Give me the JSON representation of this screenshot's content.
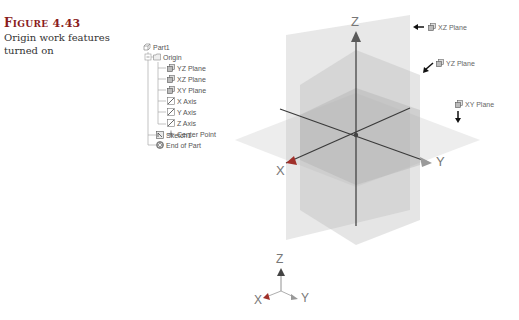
{
  "caption": {
    "figure_prefix": "F",
    "figure_word": "IGURE",
    "figure_number": "4.43",
    "description": "Origin work features turned on"
  },
  "browser_tree": {
    "items": [
      {
        "label": "Part1",
        "icon": "part-icon",
        "level": 0
      },
      {
        "label": "Origin",
        "icon": "folder-icon",
        "level": 1,
        "expanded": true
      },
      {
        "label": "YZ Plane",
        "icon": "work-plane-icon",
        "level": 2
      },
      {
        "label": "XZ Plane",
        "icon": "work-plane-icon",
        "level": 2
      },
      {
        "label": "XY Plane",
        "icon": "work-plane-icon",
        "level": 2
      },
      {
        "label": "X Axis",
        "icon": "work-axis-icon",
        "level": 2
      },
      {
        "label": "Y Axis",
        "icon": "work-axis-icon",
        "level": 2
      },
      {
        "label": "Z Axis",
        "icon": "work-axis-icon",
        "level": 2
      },
      {
        "label": "Center Point",
        "icon": "center-point-icon",
        "level": 2
      },
      {
        "label": "Sketch1",
        "icon": "sketch-icon",
        "level": 1
      },
      {
        "label": "End of Part",
        "icon": "end-of-part-icon",
        "level": 1
      }
    ]
  },
  "viewport": {
    "axes": {
      "x": "X",
      "y": "Y",
      "z": "Z"
    },
    "callouts": [
      {
        "label": "XZ Plane",
        "arrow": "left"
      },
      {
        "label": "YZ Plane",
        "arrow": "down-left"
      },
      {
        "label": "XY Plane",
        "arrow": "down"
      }
    ],
    "triad": {
      "x": "X",
      "y": "Y",
      "z": "Z"
    },
    "colors": {
      "x_axis": "#a0302a",
      "y_axis": "#8c8c8c",
      "z_axis": "#333333",
      "plane_fill": "#bdbdbd"
    }
  }
}
